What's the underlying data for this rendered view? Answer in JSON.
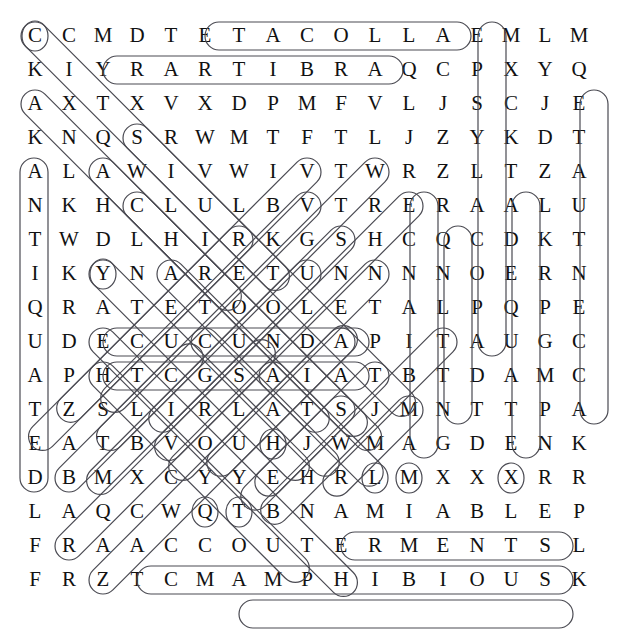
{
  "puzzle": {
    "title": "Word Search Puzzle",
    "rows": 17,
    "cols": 17,
    "cell_size": 34,
    "origin_x": 18,
    "origin_y": 18,
    "letter_color": "#111111",
    "marker_color": "#4a4a52",
    "background_color": "#ffffff",
    "grid": [
      [
        "C",
        "C",
        "M",
        "D",
        "T",
        "E",
        "T",
        "A",
        "C",
        "O",
        "L",
        "L",
        "A",
        "E",
        "M",
        "L",
        "M"
      ],
      [
        "K",
        "I",
        "Y",
        "R",
        "A",
        "R",
        "T",
        "I",
        "B",
        "R",
        "A",
        "Q",
        "C",
        "P",
        "X",
        "Y",
        "Q"
      ],
      [
        "A",
        "X",
        "T",
        "X",
        "V",
        "X",
        "D",
        "P",
        "M",
        "F",
        "V",
        "L",
        "J",
        "S",
        "C",
        "J",
        "E"
      ],
      [
        "K",
        "N",
        "Q",
        "S",
        "R",
        "W",
        "M",
        "T",
        "F",
        "T",
        "L",
        "J",
        "Z",
        "Y",
        "K",
        "D",
        "T"
      ],
      [
        "A",
        "L",
        "A",
        "W",
        "I",
        "V",
        "W",
        "I",
        "V",
        "T",
        "W",
        "R",
        "Z",
        "L",
        "T",
        "Z",
        "A"
      ],
      [
        "N",
        "K",
        "H",
        "C",
        "L",
        "U",
        "L",
        "B",
        "V",
        "T",
        "R",
        "E",
        "R",
        "A",
        "A",
        "L",
        "U"
      ],
      [
        "T",
        "W",
        "D",
        "L",
        "H",
        "I",
        "R",
        "K",
        "G",
        "S",
        "H",
        "C",
        "Q",
        "C",
        "D",
        "K",
        "T"
      ],
      [
        "I",
        "K",
        "Y",
        "N",
        "A",
        "R",
        "E",
        "T",
        "U",
        "N",
        "N",
        "N",
        "N",
        "O",
        "E",
        "R",
        "N"
      ],
      [
        "Q",
        "R",
        "A",
        "T",
        "E",
        "T",
        "O",
        "O",
        "L",
        "E",
        "T",
        "A",
        "L",
        "P",
        "Q",
        "P",
        "E"
      ],
      [
        "U",
        "D",
        "E",
        "C",
        "U",
        "C",
        "U",
        "N",
        "D",
        "A",
        "P",
        "I",
        "T",
        "A",
        "U",
        "G",
        "C"
      ],
      [
        "A",
        "P",
        "H",
        "T",
        "C",
        "G",
        "S",
        "A",
        "I",
        "A",
        "T",
        "B",
        "T",
        "D",
        "A",
        "M",
        "C"
      ],
      [
        "T",
        "Z",
        "S",
        "L",
        "I",
        "R",
        "L",
        "A",
        "T",
        "S",
        "J",
        "M",
        "N",
        "T",
        "T",
        "P",
        "A"
      ],
      [
        "E",
        "A",
        "T",
        "B",
        "V",
        "O",
        "U",
        "H",
        "J",
        "W",
        "M",
        "A",
        "G",
        "D",
        "E",
        "N",
        "K"
      ],
      [
        "D",
        "B",
        "M",
        "X",
        "C",
        "Y",
        "Y",
        "E",
        "H",
        "R",
        "L",
        "M",
        "X",
        "X",
        "X",
        "R",
        "R"
      ],
      [
        "L",
        "A",
        "Q",
        "C",
        "W",
        "Q",
        "T",
        "B",
        "N",
        "A",
        "M",
        "I",
        "A",
        "B",
        "L",
        "E",
        "P"
      ],
      [
        "F",
        "R",
        "A",
        "A",
        "C",
        "C",
        "O",
        "U",
        "T",
        "E",
        "R",
        "M",
        "E",
        "N",
        "T",
        "S",
        "L"
      ],
      [
        "F",
        "R",
        "Z",
        "T",
        "C",
        "M",
        "A",
        "M",
        "P",
        "H",
        "I",
        "B",
        "I",
        "O",
        "U",
        "S",
        "K"
      ]
    ],
    "found_words": [
      {
        "word": "ACOLLATE",
        "text": "E T A C O L L A",
        "direction": "horizontal",
        "start_row": 1,
        "start_col": 6,
        "end_row": 1,
        "end_col": 13
      },
      {
        "word": "ARBITRARY",
        "text": "Y R A R T I B R A",
        "direction": "horizontal",
        "start_row": 2,
        "start_col": 3,
        "end_row": 2,
        "end_col": 11
      },
      {
        "word": "ATOOLETA",
        "text": "A T E T O O L E",
        "direction": "horizontal",
        "start_row": 9,
        "start_col": 3,
        "end_row": 9,
        "end_col": 10
      },
      {
        "word": "ADNUCUCE",
        "text": "E C U C U N D A",
        "direction": "horizontal",
        "start_row": 10,
        "start_col": 3,
        "end_row": 10,
        "end_col": 10
      },
      {
        "word": "AMIABLE",
        "text": "A M I A B L E",
        "direction": "horizontal",
        "start_row": 15,
        "start_col": 10,
        "end_row": 15,
        "end_col": 16
      },
      {
        "word": "ACCOUTERMENTS",
        "text": "A C C O U T E R M E N T S",
        "direction": "horizontal",
        "start_row": 16,
        "start_col": 4,
        "end_row": 16,
        "end_col": 16
      },
      {
        "word": "AMPHIBIOUS",
        "text": "A M P H I B I O U S",
        "direction": "horizontal",
        "start_row": 17,
        "start_col": 7,
        "end_row": 17,
        "end_col": 16
      },
      {
        "word": "EPSYLACOPA",
        "text": "E P S Y L A C O P A",
        "direction": "vertical",
        "start_row": 1,
        "start_col": 14,
        "end_row": 10,
        "end_col": 14
      },
      {
        "word": "ETAUTNECCA",
        "text": "E T A U T N E C C A",
        "direction": "vertical",
        "start_row": 3,
        "start_col": 17,
        "end_row": 12,
        "end_col": 17
      },
      {
        "word": "ANTIQUATED",
        "text": "A N T I Q U A T E D",
        "direction": "vertical",
        "start_row": 5,
        "start_col": 1,
        "end_row": 14,
        "end_col": 1
      },
      {
        "word": "ADEQUATE",
        "text": "A D E Q U A T E",
        "direction": "vertical",
        "start_row": 6,
        "start_col": 15,
        "end_row": 13,
        "end_col": 15
      },
      {
        "word": "ERCATB",
        "text": "E C N A T B M A",
        "direction": "vertical",
        "start_row": 6,
        "start_col": 12,
        "end_row": 13,
        "end_col": 12
      },
      {
        "word": "CNOPTAE",
        "text": "C N O P T A",
        "direction": "vertical",
        "start_row": 7,
        "start_col": 13,
        "end_row": 12,
        "end_col": 13
      },
      {
        "word": "CDEQUATE",
        "text": "A D E Q U A T E",
        "direction": "vertical",
        "start_row": 6,
        "start_col": 15,
        "end_row": 13,
        "end_col": 15
      },
      {
        "word": "CANDESCENT",
        "text": "C N A R E T U N",
        "direction": "diagonal-down-right",
        "start_row": 1,
        "start_col": 1,
        "end_row": 8,
        "end_col": 8
      },
      {
        "word": "ADEQUATE2",
        "text": "A D T N A R E",
        "direction": "diagonal-down-right",
        "start_row": 3,
        "start_col": 1,
        "end_row": 9,
        "end_col": 7
      },
      {
        "word": "DIAGONAL-D",
        "text": "D A E T B",
        "direction": "diagonal-down-right",
        "start_row": 7,
        "start_col": 3,
        "end_row": 13,
        "end_col": 2
      },
      {
        "word": "ACCELERATE",
        "text": "A E C U C U N D A",
        "direction": "diagonal",
        "start_row": 9,
        "start_col": 3,
        "end_row": 13,
        "end_col": 1
      },
      {
        "word": "ANTEDATE",
        "text": "A Q C",
        "direction": "diagonal-up-right",
        "start_row": 15,
        "start_col": 2,
        "end_row": 11,
        "end_col": 5
      },
      {
        "word": "ABDICATE",
        "text": "A C C",
        "direction": "diagonal-up-right",
        "start_row": 16,
        "start_col": 3,
        "end_row": 10,
        "end_col": 6
      },
      {
        "word": "ASPERSE",
        "text": "S R G",
        "direction": "diagonal-down-left",
        "start_row": 7,
        "start_col": 10,
        "end_row": 13,
        "end_col": 6
      },
      {
        "word": "AYE",
        "text": "Y E",
        "direction": "horizontal-pair",
        "start_row": 14,
        "start_col": 6,
        "end_row": 14,
        "end_col": 8
      },
      {
        "word": "MAE",
        "text": "M A E",
        "direction": "horizontal-span",
        "start_row": 13,
        "start_col": 11,
        "end_row": 13,
        "end_col": 15
      },
      {
        "word": "ALATE",
        "text": "A",
        "direction": "single",
        "start_row": 12,
        "start_col": 8,
        "end_row": 12,
        "end_col": 8
      }
    ]
  }
}
